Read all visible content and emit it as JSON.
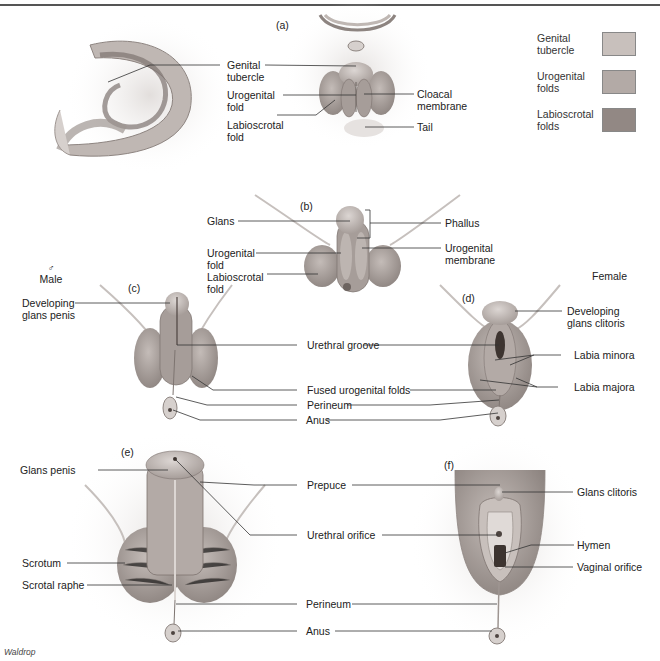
{
  "figure": {
    "credit": "Waldrop",
    "panels": {
      "a": "(a)",
      "b": "(b)",
      "c": "(c)",
      "d": "(d)",
      "e": "(e)",
      "f": "(f)"
    },
    "sex_labels": {
      "male_symbol": "♂",
      "male": "Male",
      "female": "Female"
    }
  },
  "legend": {
    "items": [
      {
        "label_1": "Genital",
        "label_2": "tubercle",
        "color": "#c8c0bc"
      },
      {
        "label_1": "Urogenital",
        "label_2": "folds",
        "color": "#b3aaa6"
      },
      {
        "label_1": "Labioscrotal",
        "label_2": "folds",
        "color": "#928884"
      }
    ]
  },
  "labels_a": {
    "genital_tubercle_1": "Genital",
    "genital_tubercle_2": "tubercle",
    "urogenital_fold_1": "Urogenital",
    "urogenital_fold_2": "fold",
    "labioscrotal_fold_1": "Labioscrotal",
    "labioscrotal_fold_2": "fold",
    "cloacal_membrane_1": "Cloacal",
    "cloacal_membrane_2": "membrane",
    "tail": "Tail"
  },
  "labels_b": {
    "glans": "Glans",
    "urogenital_fold_1": "Urogenital",
    "urogenital_fold_2": "fold",
    "labioscrotal_fold_1": "Labioscrotal",
    "labioscrotal_fold_2": "fold",
    "phallus": "Phallus",
    "urogenital_membrane_1": "Urogenital",
    "urogenital_membrane_2": "membrane"
  },
  "labels_cd": {
    "developing_glans_penis_1": "Developing",
    "developing_glans_penis_2": "glans penis",
    "developing_glans_clitoris_1": "Developing",
    "developing_glans_clitoris_2": "glans clitoris",
    "urethral_groove": "Urethral groove",
    "fused_urogenital_folds": "Fused urogenital folds",
    "perineum": "Perineum",
    "anus": "Anus",
    "labia_minora": "Labia minora",
    "labia_majora": "Labia majora"
  },
  "labels_ef": {
    "glans_penis": "Glans penis",
    "scrotum": "Scrotum",
    "scrotal_raphe": "Scrotal raphe",
    "prepuce": "Prepuce",
    "urethral_orifice": "Urethral orifice",
    "perineum": "Perineum",
    "anus": "Anus",
    "glans_clitoris": "Glans clitoris",
    "hymen": "Hymen",
    "vaginal_orifice": "Vaginal orifice"
  }
}
